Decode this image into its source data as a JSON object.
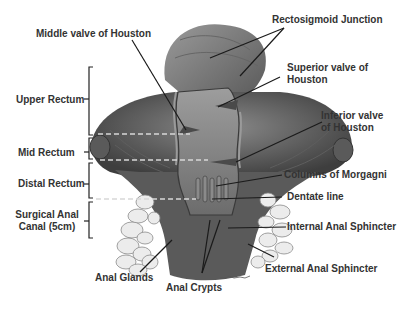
{
  "diagram": {
    "colors": {
      "background": "#ffffff",
      "label_text": "#333333",
      "tissue_dark": "#4a4a4a",
      "tissue_mid": "#7a7a7a",
      "tissue_light": "#b5b5b5",
      "fat": "#e6e6e6",
      "leader_line": "#1a1a1a",
      "dashed_line": "#d8d8d8"
    },
    "region_labels": [
      {
        "id": "upper-rectum",
        "text": "Upper Rectum"
      },
      {
        "id": "mid-rectum",
        "text": "Mid Rectum"
      },
      {
        "id": "distal-rectum",
        "text": "Distal Rectum"
      },
      {
        "id": "surgical-anal-canal",
        "text": "Surgical Anal Canal (5cm)"
      }
    ],
    "structure_labels": [
      {
        "id": "middle-valve",
        "text": "Middle valve of Houston"
      },
      {
        "id": "rectosigmoid",
        "text": "Rectosigmoid Junction"
      },
      {
        "id": "superior-valve",
        "text": "Superior valve of Houston"
      },
      {
        "id": "inferior-valve",
        "text": "Inferior valve of Houston"
      },
      {
        "id": "columns-morgagni",
        "text": "Columns of Morgagni"
      },
      {
        "id": "dentate-line",
        "text": "Dentate line"
      },
      {
        "id": "internal-sphincter",
        "text": "Internal Anal Sphincter"
      },
      {
        "id": "external-sphincter",
        "text": "External Anal Sphincter"
      },
      {
        "id": "anal-glands",
        "text": "Anal Glands"
      },
      {
        "id": "anal-crypts",
        "text": "Anal Crypts"
      }
    ]
  }
}
